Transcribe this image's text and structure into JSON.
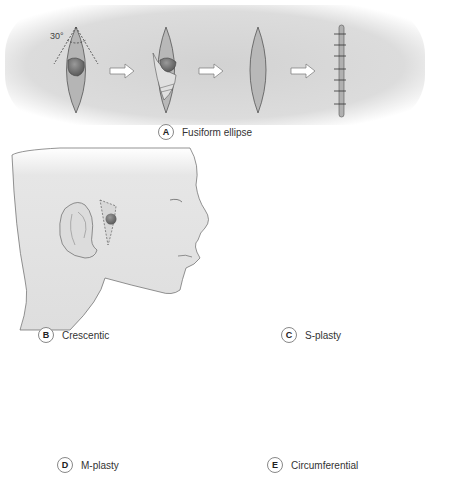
{
  "figure": {
    "panels": [
      {
        "id": "A",
        "letter": "A",
        "caption": "Fusiform ellipse",
        "angle_label": "30°"
      },
      {
        "id": "B",
        "letter": "B",
        "caption": "Crescentic"
      },
      {
        "id": "C",
        "letter": "C",
        "caption": "S-plasty"
      },
      {
        "id": "D",
        "letter": "D",
        "caption": "M-plasty"
      },
      {
        "id": "E",
        "letter": "E",
        "caption": "Circumferential"
      }
    ]
  },
  "colors": {
    "background": "#ffffff",
    "skin_shade": "#d0d0d0",
    "excision_fill": "#b8b8b8",
    "lesion": "#6e6e6e",
    "outline": "#555555"
  }
}
